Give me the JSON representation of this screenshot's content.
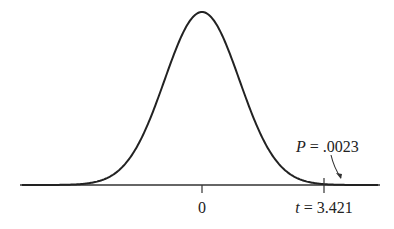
{
  "chart_data": {
    "type": "area",
    "title": "",
    "xlabel": "",
    "ylabel": "",
    "grid": false,
    "legend": null,
    "center_label": "0",
    "t_value": 3.421,
    "t_label_var": "t",
    "t_label_value": "3.421",
    "p_value": 0.0023,
    "p_label_var": "P",
    "p_label_value": ".0023",
    "shaded_region": "right tail beyond t = 3.421",
    "x_range": [
      -5,
      5
    ]
  },
  "colors": {
    "curve": "#222222",
    "shade": "#c8c8c8",
    "axis": "#333333"
  }
}
